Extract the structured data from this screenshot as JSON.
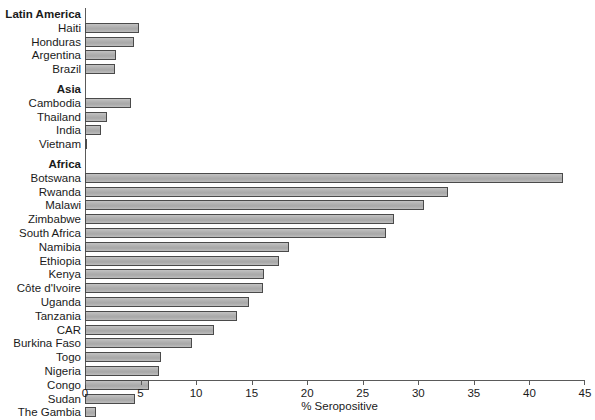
{
  "chart_data": {
    "type": "bar",
    "orientation": "horizontal",
    "title": "",
    "xlabel": "% Seropositive",
    "ylabel": "",
    "xlim": [
      0,
      45
    ],
    "xticks": [
      0,
      5,
      10,
      15,
      20,
      25,
      30,
      35,
      40,
      45
    ],
    "grid": false,
    "legend": null,
    "bar_fill_color": "#b3b3b3",
    "bar_border_color": "#4a4a4a",
    "groups": [
      {
        "name": "Latin America",
        "categories": [
          "Haiti",
          "Honduras",
          "Argentina",
          "Brazil"
        ],
        "values": [
          4.9,
          4.4,
          2.8,
          2.7
        ]
      },
      {
        "name": "Asia",
        "categories": [
          "Cambodia",
          "Thailand",
          "India",
          "Vietnam"
        ],
        "values": [
          4.1,
          2.0,
          1.4,
          0.2
        ]
      },
      {
        "name": "Africa",
        "categories": [
          "Botswana",
          "Rwanda",
          "Malawi",
          "Zimbabwe",
          "South Africa",
          "Namibia",
          "Ethiopia",
          "Kenya",
          "Côte d'Ivoire",
          "Uganda",
          "Tanzania",
          "CAR",
          "Burkina Faso",
          "Togo",
          "Nigeria",
          "Congo",
          "Sudan",
          "The Gambia"
        ],
        "values": [
          43.0,
          32.7,
          30.5,
          27.8,
          27.1,
          18.4,
          17.5,
          16.1,
          16.0,
          14.8,
          13.7,
          11.6,
          9.6,
          6.8,
          6.7,
          5.8,
          4.5,
          1.0
        ]
      }
    ]
  }
}
